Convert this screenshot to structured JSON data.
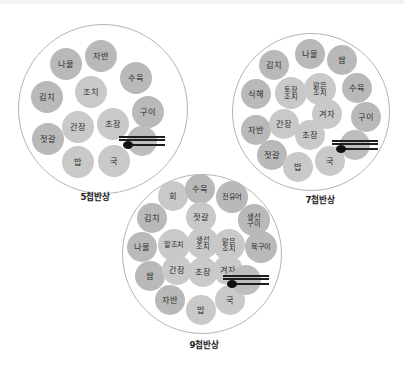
{
  "figure": {
    "title_visible": false,
    "background_color": "#ffffff",
    "outer_dish_color": "#b9b9b9",
    "inner_dish_color": "#c9c9c9",
    "plate_outline_color": "#b5b5b5",
    "utensil_color": "#1e1e1e"
  },
  "settings": [
    {
      "id": "five-cheop",
      "caption": "5첩반상",
      "plate": {
        "cx": 103,
        "cy": 109,
        "r": 85
      },
      "utensils": {
        "cx": 142,
        "cy": 141,
        "r": 15,
        "name": "spoon-and-chopsticks-icon"
      },
      "dishes": [
        {
          "label": "나물",
          "cx": 66,
          "cy": 64,
          "r": 16,
          "ring": "outer"
        },
        {
          "label": "자반",
          "cx": 101,
          "cy": 56,
          "r": 16,
          "ring": "outer"
        },
        {
          "label": "수육",
          "cx": 136,
          "cy": 78,
          "r": 16,
          "ring": "outer"
        },
        {
          "label": "김치",
          "cx": 47,
          "cy": 97,
          "r": 16,
          "ring": "outer"
        },
        {
          "label": "조치",
          "cx": 91,
          "cy": 92,
          "r": 16,
          "ring": "inner"
        },
        {
          "label": "구이",
          "cx": 148,
          "cy": 112,
          "r": 16,
          "ring": "outer"
        },
        {
          "label": "젓갈",
          "cx": 48,
          "cy": 139,
          "r": 16,
          "ring": "outer"
        },
        {
          "label": "간장",
          "cx": 78,
          "cy": 127,
          "r": 16,
          "ring": "inner"
        },
        {
          "label": "초장",
          "cx": 113,
          "cy": 124,
          "r": 16,
          "ring": "inner"
        },
        {
          "label": "밥",
          "cx": 78,
          "cy": 162,
          "r": 16,
          "ring": "inner"
        },
        {
          "label": "국",
          "cx": 114,
          "cy": 161,
          "r": 16,
          "ring": "inner"
        }
      ]
    },
    {
      "id": "seven-cheop",
      "caption": "7첩반상",
      "plate": {
        "cx": 311,
        "cy": 112,
        "r": 79
      },
      "utensils": {
        "cx": 355,
        "cy": 145,
        "r": 15,
        "name": "spoon-and-chopsticks-icon"
      },
      "dishes": [
        {
          "label": "나물",
          "cx": 310,
          "cy": 54,
          "r": 15,
          "ring": "outer"
        },
        {
          "label": "쌈",
          "cx": 342,
          "cy": 60,
          "r": 15,
          "ring": "outer"
        },
        {
          "label": "김치",
          "cx": 274,
          "cy": 65,
          "r": 15,
          "ring": "outer"
        },
        {
          "label": "토장\n조치",
          "cx": 291,
          "cy": 93,
          "r": 16,
          "ring": "inner"
        },
        {
          "label": "맑은\n조치",
          "cx": 320,
          "cy": 89,
          "r": 16,
          "ring": "inner"
        },
        {
          "label": "수육",
          "cx": 357,
          "cy": 88,
          "r": 15,
          "ring": "outer"
        },
        {
          "label": "식해",
          "cx": 256,
          "cy": 94,
          "r": 15,
          "ring": "outer"
        },
        {
          "label": "겨자",
          "cx": 327,
          "cy": 114,
          "r": 15,
          "ring": "inner"
        },
        {
          "label": "구이",
          "cx": 366,
          "cy": 117,
          "r": 15,
          "ring": "outer"
        },
        {
          "label": "자반",
          "cx": 256,
          "cy": 130,
          "r": 15,
          "ring": "outer"
        },
        {
          "label": "간장",
          "cx": 284,
          "cy": 124,
          "r": 15,
          "ring": "inner"
        },
        {
          "label": "초장",
          "cx": 310,
          "cy": 135,
          "r": 15,
          "ring": "inner"
        },
        {
          "label": "젓갈",
          "cx": 272,
          "cy": 155,
          "r": 15,
          "ring": "outer"
        },
        {
          "label": "밥",
          "cx": 298,
          "cy": 167,
          "r": 15,
          "ring": "inner"
        },
        {
          "label": "국",
          "cx": 330,
          "cy": 161,
          "r": 15,
          "ring": "inner"
        }
      ]
    },
    {
      "id": "nine-cheop",
      "caption": "9첩반상",
      "plate": {
        "cx": 202,
        "cy": 254,
        "r": 80
      },
      "utensils": {
        "cx": 246,
        "cy": 280,
        "r": 15,
        "name": "spoon-and-chopsticks-icon"
      },
      "dishes": [
        {
          "label": "회",
          "cx": 173,
          "cy": 196,
          "r": 15,
          "ring": "inner"
        },
        {
          "label": "수육",
          "cx": 200,
          "cy": 189,
          "r": 15,
          "ring": "outer"
        },
        {
          "label": "전유어",
          "cx": 232,
          "cy": 197,
          "r": 16,
          "ring": "outer"
        },
        {
          "label": "김치",
          "cx": 152,
          "cy": 218,
          "r": 15,
          "ring": "outer"
        },
        {
          "label": "젓갈",
          "cx": 201,
          "cy": 217,
          "r": 15,
          "ring": "inner"
        },
        {
          "label": "생선\n구이",
          "cx": 254,
          "cy": 220,
          "r": 16,
          "ring": "outer"
        },
        {
          "label": "나물",
          "cx": 142,
          "cy": 247,
          "r": 15,
          "ring": "outer"
        },
        {
          "label": "알조치",
          "cx": 174,
          "cy": 245,
          "r": 16,
          "ring": "inner"
        },
        {
          "label": "생선\n조치",
          "cx": 203,
          "cy": 243,
          "r": 16,
          "ring": "inner"
        },
        {
          "label": "맑은\n조치",
          "cx": 229,
          "cy": 245,
          "r": 16,
          "ring": "inner"
        },
        {
          "label": "육구이",
          "cx": 261,
          "cy": 247,
          "r": 16,
          "ring": "outer"
        },
        {
          "label": "쌈",
          "cx": 150,
          "cy": 276,
          "r": 15,
          "ring": "outer"
        },
        {
          "label": "간장",
          "cx": 177,
          "cy": 270,
          "r": 15,
          "ring": "inner"
        },
        {
          "label": "초장",
          "cx": 203,
          "cy": 272,
          "r": 15,
          "ring": "inner"
        },
        {
          "label": "겨자",
          "cx": 228,
          "cy": 270,
          "r": 15,
          "ring": "inner"
        },
        {
          "label": "자반",
          "cx": 170,
          "cy": 300,
          "r": 15,
          "ring": "outer"
        },
        {
          "label": "밥",
          "cx": 201,
          "cy": 310,
          "r": 15,
          "ring": "inner"
        },
        {
          "label": "국",
          "cx": 230,
          "cy": 300,
          "r": 15,
          "ring": "inner"
        }
      ]
    }
  ],
  "captions": {
    "five": "5첩반상",
    "seven": "7첩반상",
    "nine": "9첩반상"
  },
  "caption_positions": [
    {
      "cx": 95,
      "y": 190
    },
    {
      "cx": 320,
      "y": 193
    },
    {
      "cx": 204,
      "y": 338
    }
  ]
}
